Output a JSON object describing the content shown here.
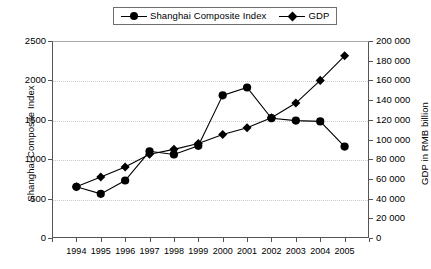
{
  "chart_data": {
    "type": "line",
    "title": "",
    "xlabel": "",
    "categories": [
      "1994",
      "1995",
      "1996",
      "1997",
      "1998",
      "1999",
      "2000",
      "2001",
      "2002",
      "2003",
      "2004",
      "2005"
    ],
    "grid": true,
    "legend_position": "top-center",
    "series": [
      {
        "name": "Shanghai Composite Index",
        "marker": "circle",
        "axis": "left",
        "values": [
          650,
          560,
          730,
          1100,
          1060,
          1170,
          1810,
          1910,
          1520,
          1490,
          1480,
          1160
        ]
      },
      {
        "name": "GDP",
        "marker": "diamond",
        "axis": "right",
        "values": [
          52000,
          62000,
          72000,
          85000,
          90000,
          96000,
          105000,
          112000,
          122000,
          137000,
          160000,
          185000
        ]
      }
    ],
    "y_left": {
      "label": "Shanghai Composite Index",
      "min": 0,
      "max": 2500,
      "step": 500,
      "ticks": [
        0,
        500,
        1000,
        1500,
        2000,
        2500
      ],
      "tick_labels": [
        "0",
        "500",
        "1000",
        "1500",
        "2000",
        "2500"
      ]
    },
    "y_right": {
      "label": "GDP in RMB billion",
      "min": 0,
      "max": 200000,
      "step": 20000,
      "ticks": [
        0,
        20000,
        40000,
        60000,
        80000,
        100000,
        120000,
        140000,
        160000,
        180000,
        200000
      ],
      "tick_labels": [
        "0",
        "20 000",
        "40 000",
        "60 000",
        "80 000",
        "100 000",
        "120 000",
        "140 000",
        "160 000",
        "180 000",
        "200 000"
      ]
    }
  },
  "legend": {
    "items": [
      {
        "label": "Shanghai Composite Index",
        "marker": "circle"
      },
      {
        "label": "GDP",
        "marker": "diamond"
      }
    ]
  }
}
